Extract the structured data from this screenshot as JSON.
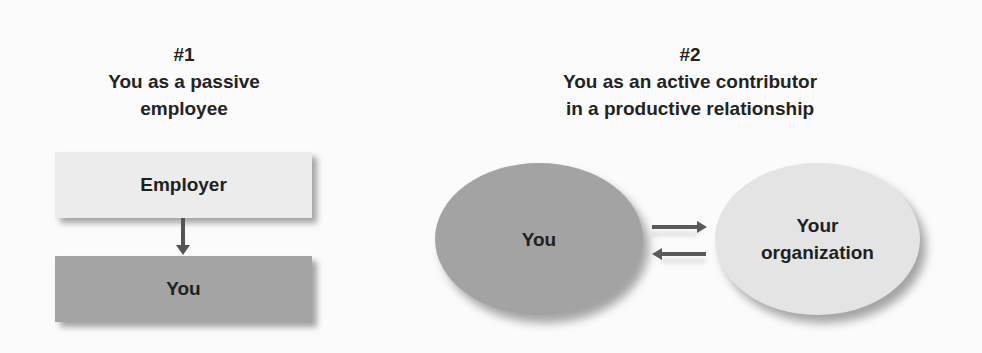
{
  "panel1": {
    "number": "#1",
    "title_lines": [
      "You as a passive",
      "employee"
    ],
    "top_box": "Employer",
    "bottom_box": "You",
    "arrow": "down"
  },
  "panel2": {
    "number": "#2",
    "title_lines": [
      "You as an active contributor",
      "in a productive relationship"
    ],
    "left_ellipse": "You",
    "right_ellipse_lines": [
      "Your",
      "organization"
    ],
    "arrows": [
      "right",
      "left"
    ]
  },
  "colors": {
    "background": "#fbfbfb",
    "light_gray": "#ececec",
    "dark_gray": "#a4a4a4",
    "arrow": "#555555",
    "text": "#222222"
  }
}
